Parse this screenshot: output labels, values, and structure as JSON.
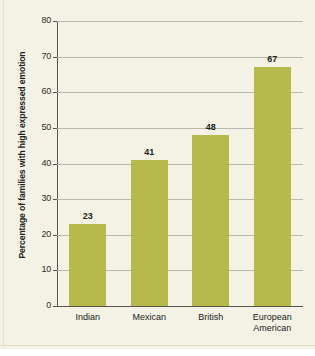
{
  "chart_data": {
    "type": "bar",
    "title": "",
    "subtitle": "",
    "xlabel": "",
    "ylabel": "Percentage of families with high expressed emotion",
    "categories": [
      "Indian",
      "Mexican",
      "British",
      "European\nAmerican"
    ],
    "values": [
      23,
      41,
      48,
      67
    ],
    "value_labels": [
      "23",
      "41",
      "48",
      "67"
    ],
    "ylim": [
      0,
      80
    ],
    "ytick_labels": [
      "0",
      "10",
      "20",
      "30",
      "40",
      "50",
      "60",
      "70",
      "80"
    ],
    "ytick_values": [
      0,
      10,
      20,
      30,
      40,
      50,
      60,
      70,
      80
    ],
    "grid": true,
    "legend": "none",
    "series": [
      {
        "name": "Percentage of families with high expressed emotion",
        "values": [
          23,
          41,
          48,
          67
        ]
      }
    ]
  },
  "style": {
    "bar_color": "#b5ba4a",
    "background_color": "#f3f2e5",
    "grid_color": "#b9b9ae",
    "axis_color": "#56564c",
    "text_color": "#22221c"
  }
}
